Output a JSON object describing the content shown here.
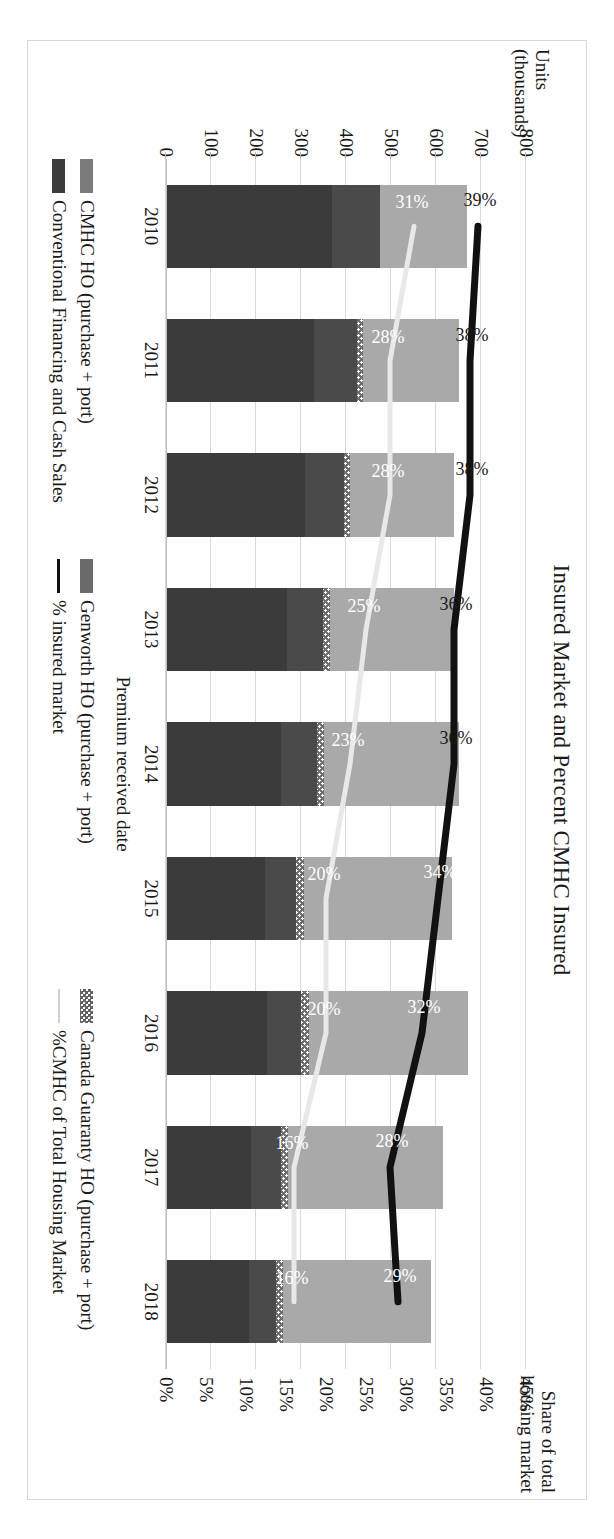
{
  "chart_data": {
    "type": "bar",
    "title": "Insured Market and Percent CMHC Insured",
    "xlabel": "Premium received date",
    "ylabel": "Units (thousands)",
    "ylabel_right": "Share of total housing market",
    "categories": [
      "2010",
      "2011",
      "2012",
      "2013",
      "2014",
      "2015",
      "2016",
      "2017",
      "2018"
    ],
    "ylim": [
      0,
      800
    ],
    "ylim_right": [
      0,
      45
    ],
    "yticks": [
      "800",
      "700",
      "600",
      "500",
      "400",
      "300",
      "200",
      "100",
      "0"
    ],
    "yticks_right": [
      "45%",
      "40%",
      "35%",
      "30%",
      "25%",
      "20%",
      "15%",
      "10%",
      "5%",
      "0%"
    ],
    "grid": true,
    "legend_position": "bottom",
    "stacked": true,
    "series": [
      {
        "name": "CMHC HO (purchase + port)",
        "color": "#3b3b3b",
        "values": [
          370,
          330,
          310,
          270,
          255,
          220,
          225,
          190,
          185
        ]
      },
      {
        "name": "Genworth HO (purchase + port)",
        "color": "#4a4a4a",
        "values": [
          105,
          95,
          85,
          80,
          80,
          70,
          75,
          65,
          60
        ]
      },
      {
        "name": "Canada Guaranty HO (purchase + port)",
        "color": "#6e6e6e",
        "values": [
          0,
          12,
          14,
          15,
          16,
          16,
          17,
          16,
          15
        ]
      },
      {
        "name": "Conventional Financing and Cash Sales",
        "color": "#a9a9a9",
        "values": [
          195,
          215,
          230,
          275,
          300,
          330,
          355,
          345,
          330
        ]
      }
    ],
    "lines": [
      {
        "name": "% insured market",
        "color": "#111111",
        "values": [
          39,
          38,
          38,
          36,
          36,
          34,
          32,
          28,
          29
        ],
        "labels": [
          "39%",
          "38%",
          "38%",
          "36%",
          "36%",
          "34%",
          "32%",
          "28%",
          "29%"
        ],
        "label_inside": [
          false,
          false,
          false,
          false,
          false,
          true,
          true,
          true,
          true
        ]
      },
      {
        "name": "%CMHC of Total Housing Market",
        "color": "#e8e8e8",
        "values": [
          31,
          28,
          28,
          25,
          23,
          20,
          20,
          16,
          16
        ],
        "labels": [
          "31%",
          "28%",
          "28%",
          "25%",
          "23%",
          "20%",
          "20%",
          "16%",
          "16%"
        ],
        "label_inside": [
          true,
          true,
          true,
          true,
          true,
          true,
          true,
          true,
          true
        ]
      }
    ]
  },
  "legend": {
    "items": [
      {
        "label": "CMHC HO (purchase + port)",
        "swatch": "cmhc"
      },
      {
        "label": "Genworth HO (purchase + port)",
        "swatch": "genworth"
      },
      {
        "label": "Canada Guaranty HO (purchase + port)",
        "swatch": "canguar"
      },
      {
        "label": "Conventional Financing and Cash Sales",
        "swatch": "conv"
      },
      {
        "label": "% insured market",
        "swatch": "lineblk"
      },
      {
        "label": "%CMHC of Total Housing Market",
        "swatch": "linewht"
      }
    ]
  }
}
